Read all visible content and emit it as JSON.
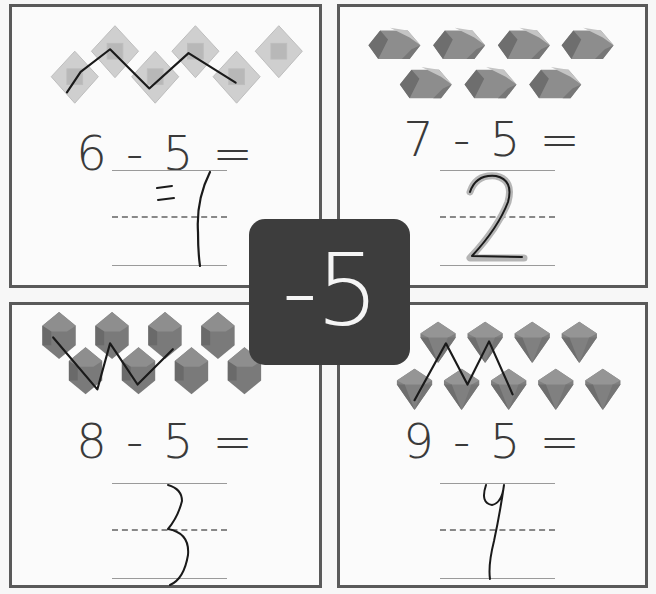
{
  "worksheet": {
    "badge_label": "-5",
    "colors": {
      "border": "#5a5a5a",
      "badge_bg": "#3d3d3d",
      "badge_text": "#f5f5f5",
      "gem_light": "#c8c8c8",
      "gem_mid": "#8a8a8a",
      "gem_dark": "#6f6f6f",
      "pen": "#1a1a1a"
    },
    "problems": [
      {
        "equation": "6 - 5 =",
        "minuend": "6",
        "operator": "-",
        "subtrahend": "5",
        "equals": "=",
        "answer": "1",
        "gem_count": 6,
        "gem_style": "light-square-diamond",
        "crossed_out": 5
      },
      {
        "equation": "7 - 5 =",
        "minuend": "7",
        "operator": "-",
        "subtrahend": "5",
        "equals": "=",
        "answer": "2",
        "gem_count": 7,
        "gem_style": "flat-hexagon-gem",
        "crossed_out": 0
      },
      {
        "equation": "8 - 5 =",
        "minuend": "8",
        "operator": "-",
        "subtrahend": "5",
        "equals": "=",
        "answer": "3",
        "gem_count": 8,
        "gem_style": "tall-hexagon-gem",
        "crossed_out": 5
      },
      {
        "equation": "9 - 5 =",
        "minuend": "9",
        "operator": "-",
        "subtrahend": "5",
        "equals": "=",
        "answer": "4",
        "gem_count": 9,
        "gem_style": "faceted-diamond",
        "crossed_out": 5
      }
    ]
  }
}
